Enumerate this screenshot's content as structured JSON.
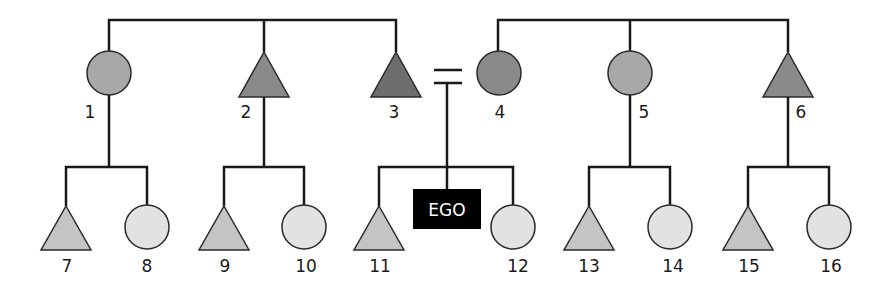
{
  "diagram": {
    "type": "kinship-chart",
    "colors": {
      "line": "#1a1a1a",
      "gen1_light": "#a8a8a8",
      "gen1_mid": "#8a8a8a",
      "gen1_dark": "#6e6e6e",
      "gen2_male": "#c4c4c4",
      "gen2_female": "#e2e2e2",
      "ego_bg": "#000000",
      "ego_text": "#ffffff"
    },
    "ego": {
      "label": "EGO"
    },
    "marriage_symbol": "=",
    "generation1": [
      {
        "id": "1",
        "label": "1",
        "sex": "female",
        "shape": "circle",
        "side": "father"
      },
      {
        "id": "2",
        "label": "2",
        "sex": "male",
        "shape": "triangle",
        "side": "father"
      },
      {
        "id": "3",
        "label": "3",
        "sex": "male",
        "shape": "triangle",
        "side": "father"
      },
      {
        "id": "4",
        "label": "4",
        "sex": "female",
        "shape": "circle",
        "side": "mother"
      },
      {
        "id": "5",
        "label": "5",
        "sex": "female",
        "shape": "circle",
        "side": "mother"
      },
      {
        "id": "6",
        "label": "6",
        "sex": "male",
        "shape": "triangle",
        "side": "mother"
      }
    ],
    "generation2": [
      {
        "id": "7",
        "label": "7",
        "sex": "male",
        "shape": "triangle",
        "parent": "1"
      },
      {
        "id": "8",
        "label": "8",
        "sex": "female",
        "shape": "circle",
        "parent": "1"
      },
      {
        "id": "9",
        "label": "9",
        "sex": "male",
        "shape": "triangle",
        "parent": "2"
      },
      {
        "id": "10",
        "label": "10",
        "sex": "female",
        "shape": "circle",
        "parent": "2"
      },
      {
        "id": "11",
        "label": "11",
        "sex": "male",
        "shape": "triangle",
        "parent": "3+4"
      },
      {
        "id": "12",
        "label": "12",
        "sex": "female",
        "shape": "circle",
        "parent": "3+4"
      },
      {
        "id": "13",
        "label": "13",
        "sex": "male",
        "shape": "triangle",
        "parent": "5"
      },
      {
        "id": "14",
        "label": "14",
        "sex": "female",
        "shape": "circle",
        "parent": "5"
      },
      {
        "id": "15",
        "label": "15",
        "sex": "male",
        "shape": "triangle",
        "parent": "6"
      },
      {
        "id": "16",
        "label": "16",
        "sex": "female",
        "shape": "circle",
        "parent": "6"
      }
    ]
  }
}
